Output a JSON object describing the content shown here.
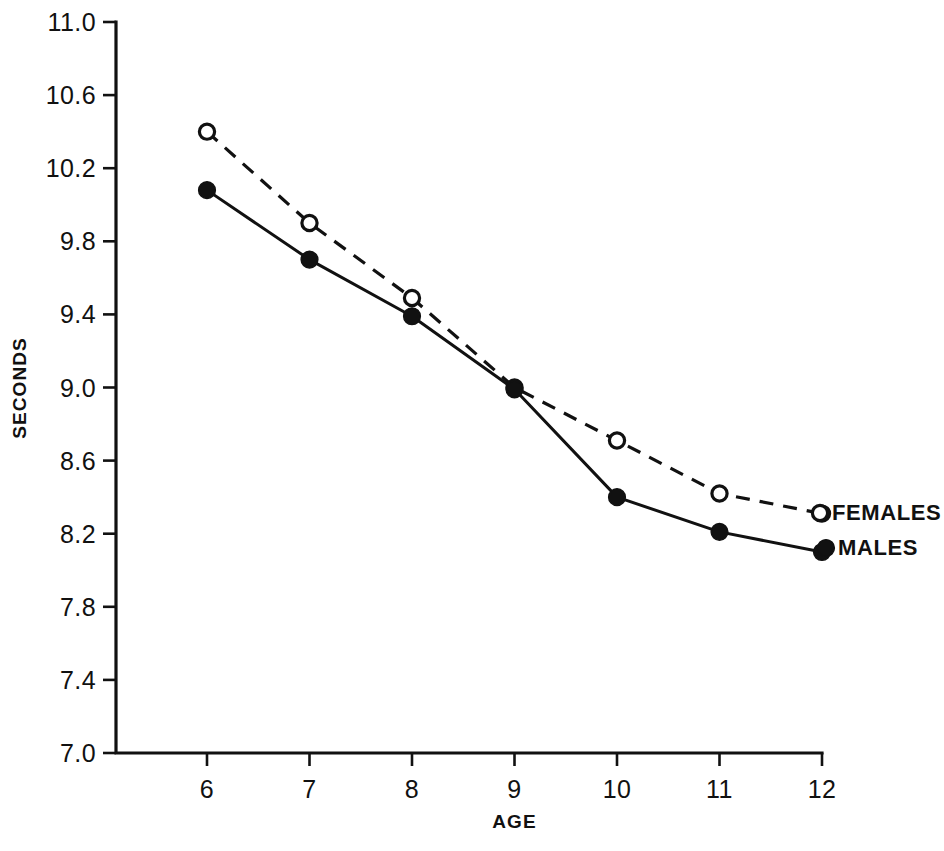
{
  "chart_data": {
    "type": "line",
    "title": "",
    "xlabel": "AGE",
    "ylabel": "SECONDS",
    "x": [
      6,
      7,
      8,
      9,
      10,
      11,
      12
    ],
    "categories": [
      "6",
      "7",
      "8",
      "9",
      "10",
      "11",
      "12"
    ],
    "xlim": [
      5.5,
      12.2
    ],
    "ylim": [
      7.0,
      11.0
    ],
    "yticks": [
      11.0,
      10.6,
      10.2,
      9.8,
      9.4,
      9.0,
      8.6,
      8.2,
      7.8,
      7.4,
      7.0
    ],
    "ytick_labels": [
      "11.0",
      "10.6",
      "10.2",
      "9.8",
      "9.4",
      "9.0",
      "8.6",
      "8.2",
      "7.8",
      "7.4",
      "7.0"
    ],
    "xtick_labels": [
      "6",
      "7",
      "8",
      "9",
      "10",
      "11",
      "12"
    ],
    "grid": false,
    "legend_position": "inline-right-end-of-line",
    "series": [
      {
        "name": "FEMALES",
        "marker": "open-circle",
        "linestyle": "dashed",
        "color": "#111111",
        "values": [
          10.4,
          9.9,
          9.49,
          9.0,
          8.71,
          8.42,
          8.31
        ]
      },
      {
        "name": "MALES",
        "marker": "filled-circle",
        "linestyle": "solid",
        "color": "#111111",
        "values": [
          10.08,
          9.7,
          9.39,
          8.99,
          8.4,
          8.21,
          8.1
        ]
      }
    ]
  },
  "labels": {
    "y_axis_title": "SECONDS",
    "x_axis_title": "AGE",
    "females": "FEMALES",
    "males": "MALES"
  },
  "ytick_labels": [
    "11.0",
    "10.6",
    "10.2",
    "9.8",
    "9.4",
    "9.0",
    "8.6",
    "8.2",
    "7.8",
    "7.4",
    "7.0"
  ],
  "xtick_labels": [
    "6",
    "7",
    "8",
    "9",
    "10",
    "11",
    "12"
  ]
}
